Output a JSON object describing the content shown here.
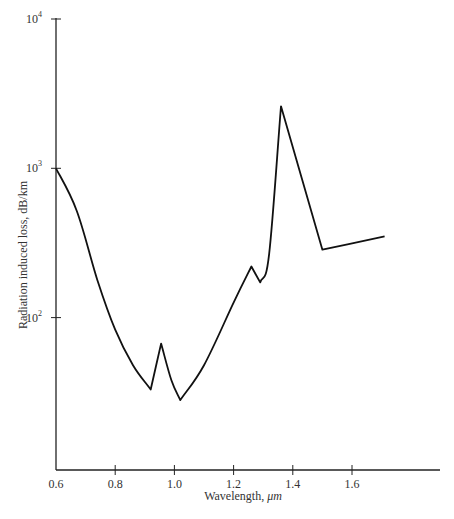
{
  "chart_data": {
    "type": "line",
    "title": "",
    "xlabel": "Wavelength, μm",
    "ylabel": "Radiation induced loss, dB/km",
    "xscale": "linear",
    "yscale": "log",
    "xlim": [
      0.6,
      1.82
    ],
    "ylim": [
      10,
      10000
    ],
    "grid": false,
    "legend": null,
    "x_ticks": [
      0.6,
      0.8,
      1.0,
      1.2,
      1.4,
      1.6
    ],
    "x_tick_labels": [
      "0.6",
      "0.8",
      "1.0",
      "1.2",
      "1.4",
      "1.6"
    ],
    "y_ticks": [
      100,
      1000,
      10000
    ],
    "y_tick_labels": [
      {
        "base": "10",
        "exp": "2"
      },
      {
        "base": "10",
        "exp": "3"
      },
      {
        "base": "10",
        "exp": "4"
      }
    ],
    "series": [
      {
        "name": "Radiation induced loss",
        "x": [
          0.6,
          0.67,
          0.74,
          0.8,
          0.86,
          0.92,
          0.955,
          0.99,
          1.02,
          1.1,
          1.2,
          1.26,
          1.29,
          1.32,
          1.36,
          1.5,
          1.71
        ],
        "values": [
          1000,
          520,
          178,
          83,
          48,
          33,
          67,
          38,
          28,
          48,
          126,
          220,
          172,
          265,
          2600,
          285,
          350
        ]
      }
    ]
  },
  "axes": {
    "xlabel_text": "Wavelength,",
    "xlabel_unit": "μm",
    "ylabel": "Radiation induced loss, dB/km"
  }
}
